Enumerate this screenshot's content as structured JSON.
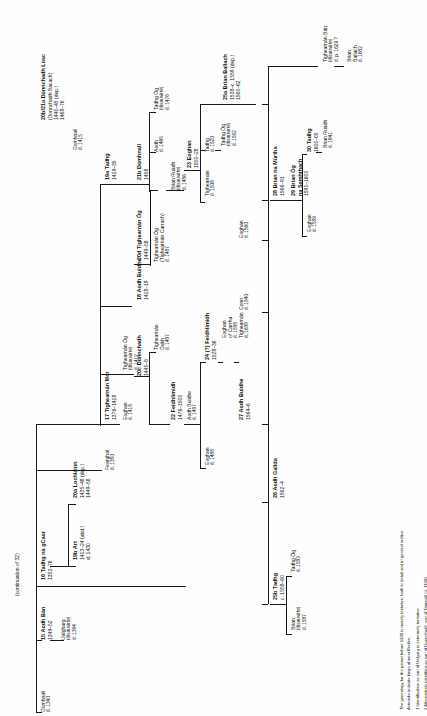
{
  "plate": {
    "title": "Genealogy of the O'Rourke kings of west Breifne",
    "continuation_note": "(continuation of 32)"
  },
  "footnotes": [
    "The genealogy for the period before 1300 is merely tentative, both in detail and in general outline.",
    "Asterisks indicate kings of west Breifne.",
    "1 Identification as son of Ualgarg is extremely tentative.",
    "2 Alternatively identified as son of Donnchadh, son of Domnall (d. 1108)."
  ],
  "nodes": [
    {
      "id": "domhnall-1340",
      "name": "Domhnall",
      "dates": "d. 1340",
      "bold": false,
      "small": true,
      "x": 40,
      "y": 712
    },
    {
      "id": "aodh-ban-15",
      "name": "15 Aodh Bán",
      "dates": "1349–52",
      "bold": true,
      "small": false,
      "x": 40,
      "y": 640
    },
    {
      "id": "ualgharg",
      "name": "Ualgharg",
      "dates": "(disauvirte)|d. 1384",
      "bold": false,
      "small": true,
      "x": 60,
      "y": 640
    },
    {
      "id": "tadhg-na-gcaor-16",
      "name": "16 Tadhg na gCaor",
      "dates": "1352–76",
      "bold": true,
      "small": false,
      "x": 40,
      "y": 580
    },
    {
      "id": "art-19b",
      "name": "19b Art",
      "dates": "1413–24 (abd.)|d. 1430",
      "bold": true,
      "small": false,
      "x": 72,
      "y": 560
    },
    {
      "id": "lochlainn-20a",
      "name": "20a Lochlainn",
      "dates": "1435–48 (dep.)|1449–58",
      "bold": true,
      "small": false,
      "x": 72,
      "y": 498
    },
    {
      "id": "fearghal-1350",
      "name": "Fearghal",
      "dates": "d. 1350",
      "bold": false,
      "small": true,
      "x": 104,
      "y": 470
    },
    {
      "id": "tighearnan-mor-17",
      "name": "17 Tighearnán Mór",
      "dates": "1376–1418",
      "bold": true,
      "small": false,
      "x": 104,
      "y": 420
    },
    {
      "id": "eoghan-1418",
      "name": "Eoghan",
      "dates": "d. 1418",
      "bold": false,
      "small": true,
      "x": 122,
      "y": 420
    },
    {
      "id": "tighearnan-og-1412",
      "name": "Tighearnán Óg",
      "dates": "(disauvirte)|d. 1412",
      "bold": false,
      "small": true,
      "x": 122,
      "y": 370
    },
    {
      "id": "aodh-buidhe-18",
      "name": "18 Aodh Buidhe",
      "dates": "1418–19",
      "bold": true,
      "small": false,
      "x": 136,
      "y": 300
    },
    {
      "id": "donnchadh-20c",
      "name": "20c Donnchadh",
      "dates": "1445–9",
      "bold": true,
      "small": false,
      "x": 136,
      "y": 376
    },
    {
      "id": "tighearnan-dubh",
      "name": "Tighearnán|Dubh",
      "dates": "d. 1487",
      "bold": false,
      "small": true,
      "x": 153,
      "y": 350
    },
    {
      "id": "feidhlimidh-22",
      "name": "22 Feidhlimidh",
      "dates": "1476–1500",
      "bold": true,
      "small": false,
      "x": 170,
      "y": 420
    },
    {
      "id": "tighearnan-og-20d",
      "name": "20d Tighearnán Óg",
      "dates": "1449–58",
      "bold": true,
      "small": false,
      "x": 136,
      "y": 260
    },
    {
      "id": "tighearnan-carrach",
      "name": "Tighearnán Óg|(Tighearnán Carrach)",
      "dates": "d. 1487",
      "bold": false,
      "small": true,
      "x": 153,
      "y": 262
    },
    {
      "id": "tadhg-19a",
      "name": "19a Tadhg",
      "dates": "1419–35",
      "bold": true,
      "small": false,
      "x": 104,
      "y": 180
    },
    {
      "id": "domhnall-1415",
      "name": "Domhnall",
      "dates": "d. 1415",
      "bold": false,
      "small": true,
      "x": 72,
      "y": 150
    },
    {
      "id": "donnchadh-losc",
      "name": "20b/21a Donnchadh Losc",
      "dates": "(Donnchadh Bacach)|1440–45 (dep.)|1468–76",
      "bold": true,
      "small": false,
      "x": 40,
      "y": 120
    },
    {
      "id": "domhnall-21b",
      "name": "21b Domhnall",
      "dates": "1458",
      "bold": true,
      "small": false,
      "x": 136,
      "y": 180
    },
    {
      "id": "aodh-1465",
      "name": "Aodh",
      "dates": "d. 1465",
      "bold": false,
      "small": true,
      "x": 153,
      "y": 152
    },
    {
      "id": "tadhg-og-1476",
      "name": "Tadhg Óg",
      "dates": "(disauvirte)|d. 1476",
      "bold": false,
      "small": true,
      "x": 153,
      "y": 110
    },
    {
      "id": "brian-ruadh-1486",
      "name": "Brian Ruadh",
      "dates": "(disauvirte)|d. 1486",
      "bold": false,
      "small": true,
      "x": 170,
      "y": 190
    },
    {
      "id": "eoghan-23",
      "name": "23 Eoghan",
      "dates": "1500–28",
      "bold": true,
      "small": false,
      "x": 186,
      "y": 168
    },
    {
      "id": "tighearnan-1508",
      "name": "Tighearnán",
      "dates": "d. 1508",
      "bold": false,
      "small": true,
      "x": 204,
      "y": 196
    },
    {
      "id": "tadhg-1520",
      "name": "Tadhg",
      "dates": "d. 1520",
      "bold": false,
      "small": true,
      "x": 204,
      "y": 152
    },
    {
      "id": "tadhg-og-1552",
      "name": "Tadhg Óg",
      "dates": "(disauvirte)|d. 1552",
      "bold": false,
      "small": true,
      "x": 220,
      "y": 146
    },
    {
      "id": "brian-ballach-25a",
      "name": "25a Brian Ballach",
      "dates": "1538–c. 1559 (dep.)|1560–62",
      "bold": true,
      "small": false,
      "x": 222,
      "y": 100
    },
    {
      "id": "aodh-buidhe-1487",
      "name": "Aodh Buidhe",
      "dates": "d. 1487",
      "bold": false,
      "small": true,
      "x": 186,
      "y": 420
    },
    {
      "id": "eoghan-1488",
      "name": "Eoghan",
      "dates": "d. 1488",
      "bold": false,
      "small": true,
      "x": 204,
      "y": 465
    },
    {
      "id": "feidhlimidh-24",
      "name": "24 (?) Feidhlimidh",
      "dates": "1528–36",
      "bold": true,
      "small": false,
      "x": 204,
      "y": 360
    },
    {
      "id": "eoghan-carrha",
      "name": "Eoghan|of Carrha",
      "dates": "d. 1588",
      "bold": false,
      "small": true,
      "x": 221,
      "y": 338
    },
    {
      "id": "tighearnan-1638",
      "name": "Tighearnán",
      "dates": "d. 1638",
      "bold": false,
      "small": true,
      "x": 238,
      "y": 338
    },
    {
      "id": "aodh-buidhe-27",
      "name": "27 Aodh Buidhe",
      "dates": "1564–6",
      "bold": true,
      "small": false,
      "x": 238,
      "y": 420
    },
    {
      "id": "conn-1540",
      "name": "Conn",
      "dates": "d. 1540",
      "bold": false,
      "small": true,
      "x": 238,
      "y": 310
    },
    {
      "id": "eoghan-1560",
      "name": "Eoghan",
      "dates": "d. 1560",
      "bold": false,
      "small": true,
      "x": 238,
      "y": 238
    },
    {
      "id": "tadhg-25b",
      "name": "25b Tadhg",
      "dates": "c. 1559–60",
      "bold": true,
      "small": false,
      "x": 272,
      "y": 600
    },
    {
      "id": "brian-1587",
      "name": "Brian",
      "dates": "(disauvirte)|d. 1587",
      "bold": false,
      "small": true,
      "x": 290,
      "y": 630
    },
    {
      "id": "tadhg-og-1583",
      "name": "Tadhg Óg",
      "dates": "d. 1583",
      "bold": false,
      "small": true,
      "x": 290,
      "y": 572
    },
    {
      "id": "aodh-gallda-26",
      "name": "26 Aodh Gallda",
      "dates": "1562–4",
      "bold": true,
      "small": false,
      "x": 272,
      "y": 498
    },
    {
      "id": "brian-na-murtha-28",
      "name": "28 Brian na Múrtha",
      "dates": "1566–91",
      "bold": true,
      "small": false,
      "x": 272,
      "y": 196
    },
    {
      "id": "brian-og-29",
      "name": "29 Brian Óg|na Samhthach",
      "dates": "1591–1600",
      "bold": true,
      "small": false,
      "x": 290,
      "y": 196
    },
    {
      "id": "eoghan-1589",
      "name": "Eoghan",
      "dates": "d. 1589",
      "bold": false,
      "small": true,
      "x": 306,
      "y": 232
    },
    {
      "id": "tadhg-30",
      "name": "30 Tadhg",
      "dates": "1600–05",
      "bold": true,
      "small": false,
      "x": 306,
      "y": 152
    },
    {
      "id": "brian-ruadh-1641",
      "name": "Brian Ruadh",
      "dates": "d. 1641",
      "bold": false,
      "small": true,
      "x": 322,
      "y": 148
    },
    {
      "id": "tighearnan-ban",
      "name": "Tighearnán Bán",
      "dates": "(disauvirte)|d. p. 1629 ?",
      "bold": false,
      "small": true,
      "x": 322,
      "y": 62
    },
    {
      "id": "brian-ballach-1682",
      "name": "Brian|Ballach",
      "dates": "d. 1682",
      "bold": false,
      "small": true,
      "x": 346,
      "y": 62
    }
  ]
}
